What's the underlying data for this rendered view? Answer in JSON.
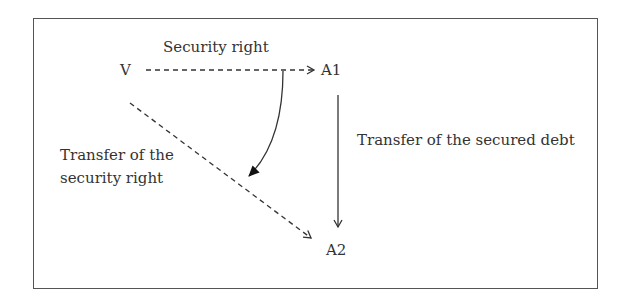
{
  "diagram": {
    "nodes": {
      "v": "V",
      "a1": "A1",
      "a2": "A2"
    },
    "labels": {
      "security_right": "Security right",
      "transfer_secured_debt": "Transfer of the secured debt",
      "transfer_security_right_line1": "Transfer of the",
      "transfer_security_right_line2": "security right"
    },
    "edges": [
      {
        "from": "V",
        "to": "A1",
        "label": "Security right",
        "style": "dashed"
      },
      {
        "from": "A1",
        "to": "A2",
        "label": "Transfer of the secured debt",
        "style": "solid"
      },
      {
        "from": "V",
        "to": "A2",
        "label": "Transfer of the security right",
        "style": "dashed"
      },
      {
        "from": "V-A1 edge",
        "to": "V-A2 edge",
        "label": "",
        "style": "curved-solid"
      }
    ],
    "colors": {
      "line": "#333333",
      "text": "#333333"
    }
  }
}
